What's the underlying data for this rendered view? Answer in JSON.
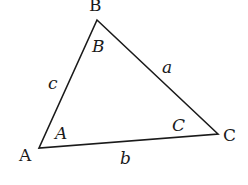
{
  "diagram": {
    "type": "triangle",
    "stroke_color": "#1a1a1a",
    "background": "#ffffff",
    "vertices": {
      "A": {
        "label": "A",
        "x": 39,
        "y": 148
      },
      "B": {
        "label": "B",
        "x": 97,
        "y": 20
      },
      "C": {
        "label": "C",
        "x": 218,
        "y": 134
      }
    },
    "angles": {
      "A": "A",
      "B": "B",
      "C": "C"
    },
    "sides": {
      "a": "a",
      "b": "b",
      "c": "c"
    }
  }
}
